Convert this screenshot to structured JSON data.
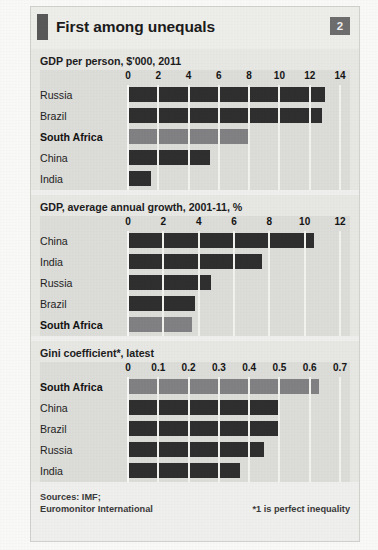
{
  "figure": {
    "title": "First among unequals",
    "badge": "2",
    "sources": "Sources: IMF;\nEuromonitor International",
    "footnote": "*1 is perfect inequality",
    "colors": {
      "bar_default": "#2f2f30",
      "bar_highlight": "#828284",
      "panel_background": "#dededa",
      "gridline": "#f4f4f1",
      "badge_background": "#6e6e6f",
      "accent_mark": "#59595a"
    },
    "highlight_category": "South Africa"
  },
  "chart_data": [
    {
      "type": "bar",
      "orientation": "horizontal",
      "title": "GDP per person, $'000, 2011",
      "xlabel": "",
      "ylabel": "",
      "xlim": [
        0,
        14
      ],
      "ticks": [
        "0",
        "2",
        "4",
        "6",
        "8",
        "10",
        "12",
        "14"
      ],
      "tick_values": [
        0,
        2,
        4,
        6,
        8,
        10,
        12,
        14
      ],
      "grid": true,
      "legend": "none",
      "categories": [
        "Russia",
        "Brazil",
        "South Africa",
        "China",
        "India"
      ],
      "values": [
        13.0,
        12.8,
        8.0,
        5.4,
        1.5
      ],
      "highlight": [
        "South Africa"
      ]
    },
    {
      "type": "bar",
      "orientation": "horizontal",
      "title": "GDP, average annual growth, 2001-11, %",
      "xlabel": "",
      "ylabel": "",
      "xlim": [
        0,
        12
      ],
      "ticks": [
        "0",
        "2",
        "4",
        "6",
        "8",
        "10",
        "12"
      ],
      "tick_values": [
        0,
        2,
        4,
        6,
        8,
        10,
        12
      ],
      "grid": true,
      "legend": "none",
      "categories": [
        "China",
        "India",
        "Russia",
        "Brazil",
        "South Africa"
      ],
      "values": [
        10.5,
        7.6,
        4.7,
        3.8,
        3.6
      ],
      "highlight": [
        "South Africa"
      ]
    },
    {
      "type": "bar",
      "orientation": "horizontal",
      "title": "Gini coefficient*, latest",
      "xlabel": "",
      "ylabel": "",
      "xlim": [
        0,
        0.7
      ],
      "ticks": [
        "0",
        "0.1",
        "0.2",
        "0.3",
        "0.4",
        "0.5",
        "0.6",
        "0.7"
      ],
      "tick_values": [
        0,
        0.1,
        0.2,
        0.3,
        0.4,
        0.5,
        0.6,
        0.7
      ],
      "grid": true,
      "legend": "none",
      "categories": [
        "South Africa",
        "China",
        "Brazil",
        "Russia",
        "India"
      ],
      "values": [
        0.63,
        0.5,
        0.5,
        0.45,
        0.37
      ],
      "highlight": [
        "South Africa"
      ]
    }
  ]
}
